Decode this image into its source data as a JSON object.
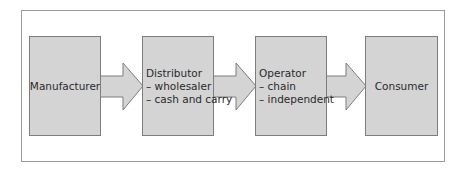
{
  "diagram": {
    "type": "process-flow",
    "direction": "left-to-right",
    "colors": {
      "box_fill": "#d4d4d4",
      "box_border": "#7d7d7d",
      "frame_border": "#9a9a9a",
      "text": "#2a2a2a"
    },
    "nodes": [
      {
        "id": "manufacturer",
        "title": "Manufacturer",
        "items": []
      },
      {
        "id": "distributor",
        "title": "Distributor",
        "items": [
          "– wholesaler",
          "– cash and carry"
        ]
      },
      {
        "id": "operator",
        "title": "Operator",
        "items": [
          "– chain",
          "– independent"
        ]
      },
      {
        "id": "consumer",
        "title": "Consumer",
        "items": []
      }
    ],
    "edges": [
      {
        "from": "manufacturer",
        "to": "distributor"
      },
      {
        "from": "distributor",
        "to": "operator"
      },
      {
        "from": "operator",
        "to": "consumer"
      }
    ]
  }
}
